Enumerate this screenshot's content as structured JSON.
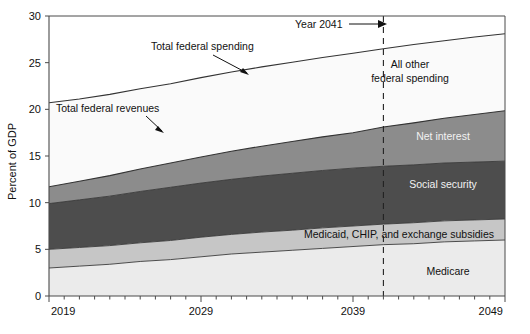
{
  "chart_data": {
    "type": "area",
    "title": "",
    "subtitle": "",
    "xlabel": "",
    "ylabel": "Percent of GDP",
    "xlim": [
      2019,
      2049
    ],
    "ylim": [
      0,
      30
    ],
    "ytick_labels": [
      "0",
      "5",
      "10",
      "15",
      "20",
      "25",
      "30"
    ],
    "ytick_values": [
      0,
      5,
      10,
      15,
      20,
      25,
      30
    ],
    "xtick_labels": [
      "2019",
      "2029",
      "2039",
      "2049"
    ],
    "xtick_values": [
      2019,
      2029,
      2039,
      2049
    ],
    "xtick_minor_step": 1,
    "grid": false,
    "legend_position": "in-plot-labels",
    "x": [
      2019,
      2021,
      2023,
      2025,
      2027,
      2029,
      2031,
      2033,
      2035,
      2037,
      2039,
      2041,
      2043,
      2045,
      2047,
      2049
    ],
    "series": [
      {
        "name": "Medicare",
        "label": "Medicare",
        "color": "#ebebeb",
        "stack_order": 1,
        "values": [
          3.0,
          3.2,
          3.4,
          3.7,
          3.9,
          4.2,
          4.5,
          4.7,
          4.9,
          5.1,
          5.3,
          5.5,
          5.6,
          5.8,
          5.9,
          6.0
        ]
      },
      {
        "name": "Medicaid, CHIP, and exchange subsidies",
        "label": "Medicaid, CHIP, and exchange subsidies",
        "color": "#c6c6c6",
        "stack_order": 2,
        "values": [
          2.0,
          2.0,
          2.0,
          2.0,
          2.05,
          2.1,
          2.1,
          2.15,
          2.15,
          2.2,
          2.2,
          2.2,
          2.25,
          2.25,
          2.25,
          2.25
        ]
      },
      {
        "name": "Social security",
        "label": "Social security",
        "color": "#4d4d4d",
        "stack_order": 3,
        "values": [
          4.9,
          5.1,
          5.3,
          5.5,
          5.7,
          5.8,
          5.9,
          6.0,
          6.1,
          6.15,
          6.2,
          6.2,
          6.2,
          6.2,
          6.2,
          6.2
        ]
      },
      {
        "name": "Net interest",
        "label": "Net interest",
        "color": "#8c8c8c",
        "stack_order": 4,
        "values": [
          1.8,
          2.0,
          2.2,
          2.4,
          2.6,
          2.8,
          3.0,
          3.2,
          3.4,
          3.6,
          3.8,
          4.2,
          4.5,
          4.8,
          5.1,
          5.4
        ]
      },
      {
        "name": "All other federal spending",
        "label": "All other federal spending",
        "color": "#fafafa",
        "stack_order": 5,
        "values": [
          9.0,
          8.8,
          8.7,
          8.6,
          8.5,
          8.5,
          8.5,
          8.5,
          8.5,
          8.5,
          8.5,
          8.4,
          8.4,
          8.3,
          8.3,
          8.25
        ]
      }
    ],
    "cumulative_boundaries": {
      "medicare_top": [
        3.0,
        3.2,
        3.4,
        3.7,
        3.9,
        4.2,
        4.5,
        4.7,
        4.9,
        5.1,
        5.3,
        5.5,
        5.6,
        5.8,
        5.9,
        6.0
      ],
      "medicaid_top": [
        5.0,
        5.2,
        5.4,
        5.7,
        5.95,
        6.3,
        6.6,
        6.85,
        7.05,
        7.3,
        7.5,
        7.7,
        7.85,
        8.05,
        8.15,
        8.25
      ],
      "social_security_top": [
        9.9,
        10.3,
        10.7,
        11.2,
        11.65,
        12.1,
        12.5,
        12.85,
        13.15,
        13.45,
        13.7,
        13.9,
        14.05,
        14.25,
        14.35,
        14.45
      ],
      "net_interest_top": [
        11.7,
        12.3,
        12.9,
        13.6,
        14.25,
        14.9,
        15.5,
        16.05,
        16.55,
        17.05,
        17.5,
        18.1,
        18.55,
        19.05,
        19.45,
        19.85
      ],
      "total_spending_top": [
        20.7,
        21.1,
        21.6,
        22.2,
        22.75,
        23.4,
        24.0,
        24.55,
        25.05,
        25.55,
        26.0,
        26.5,
        26.95,
        27.35,
        27.75,
        28.1
      ]
    },
    "lines": [
      {
        "name": "Total federal spending",
        "label": "Total federal spending",
        "values": [
          20.7,
          21.1,
          21.6,
          22.2,
          22.75,
          23.4,
          24.0,
          24.55,
          25.05,
          25.55,
          26.0,
          26.5,
          26.95,
          27.35,
          27.75,
          28.1
        ]
      },
      {
        "name": "Total federal revenues",
        "label": "Total federal revenues",
        "values": [
          11.7,
          12.3,
          12.9,
          13.6,
          14.25,
          14.9,
          15.5,
          16.05,
          16.55,
          17.05,
          17.5,
          18.1,
          18.55,
          19.05,
          19.45,
          19.85
        ]
      }
    ],
    "annotations": [
      {
        "name": "year-2041-marker",
        "text": "Year 2041",
        "x": 2041,
        "type": "vertical-dashed-line-with-arrow"
      }
    ]
  },
  "labels": {
    "y_axis_title": "Percent of GDP",
    "total_federal_spending": "Total federal spending",
    "total_federal_revenues": "Total federal revenues",
    "all_other_federal_spending_line1": "All other",
    "all_other_federal_spending_line2": "federal spending",
    "net_interest": "Net interest",
    "social_security": "Social security",
    "medicaid_chip": "Medicaid, CHIP, and exchange subsidies",
    "medicare": "Medicare",
    "year_2041": "Year 2041"
  },
  "ticks": {
    "y": [
      "30",
      "25",
      "20",
      "15",
      "10",
      "5",
      "0"
    ],
    "x": [
      "2019",
      "2029",
      "2039",
      "2049"
    ]
  },
  "colors": {
    "medicare": "#ebebeb",
    "medicaid": "#c6c6c6",
    "social_security": "#4d4d4d",
    "net_interest": "#8c8c8c",
    "all_other": "#fafafa",
    "axis": "#4a4a4a",
    "line": "#333333",
    "text": "#111111"
  }
}
